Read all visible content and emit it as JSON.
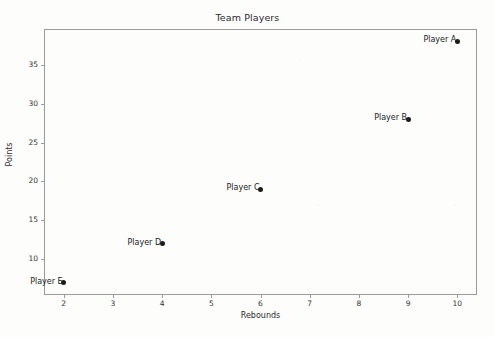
{
  "chart_data": {
    "type": "scatter",
    "title": "Team Players",
    "xlabel": "Rebounds",
    "ylabel": "Points",
    "xlim": [
      1.6,
      10.4
    ],
    "ylim": [
      5.4,
      39.6
    ],
    "grid": false,
    "legend": null,
    "xticks": [
      "2",
      "3",
      "4",
      "5",
      "6",
      "7",
      "8",
      "9",
      "10"
    ],
    "xtick_values": [
      2,
      3,
      4,
      5,
      6,
      7,
      8,
      9,
      10
    ],
    "yticks": [
      "10",
      "15",
      "20",
      "25",
      "30",
      "35"
    ],
    "ytick_values": [
      10,
      15,
      20,
      25,
      30,
      35
    ],
    "marker_color": "#1c1c1c",
    "points": [
      {
        "label": "Player A",
        "x": 10,
        "y": 38
      },
      {
        "label": "Player B",
        "x": 9,
        "y": 28
      },
      {
        "label": "Player C",
        "x": 6,
        "y": 19
      },
      {
        "label": "Player D",
        "x": 4,
        "y": 12
      },
      {
        "label": "Player E",
        "x": 2,
        "y": 7
      }
    ]
  }
}
